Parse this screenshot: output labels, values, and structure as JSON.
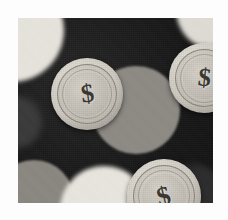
{
  "image": {
    "kind": "photograph",
    "subject": "dollar-sign coins on dark background",
    "palette": {
      "background_dark": "#151515",
      "coin_light": "#cfcbc2",
      "coin_face": "#c2beb5",
      "dollar_dark": "#3a3833",
      "disc_light": "#e6e3dc",
      "disc_mid": "#8d8a84",
      "frame_white": "#fdfdfd"
    },
    "frame": {
      "left": 18,
      "top": 18,
      "width": 195,
      "height": 185
    },
    "discs": [
      {
        "name": "disc-top-left-light",
        "cx": -6,
        "cy": 12,
        "r": 52,
        "color": "#e6e3dc",
        "blur": 2
      },
      {
        "name": "disc-top-right-light",
        "cx": 198,
        "cy": -8,
        "r": 40,
        "color": "#dedbd4",
        "blur": 2
      },
      {
        "name": "disc-center-mid",
        "cx": 118,
        "cy": 92,
        "r": 44,
        "color": "#8d8a84",
        "blur": 1
      },
      {
        "name": "disc-bottom-left-mid",
        "cx": 16,
        "cy": 182,
        "r": 40,
        "color": "#8a8781",
        "blur": 1
      },
      {
        "name": "disc-bottom-left-light",
        "cx": 86,
        "cy": 192,
        "r": 44,
        "color": "#e8e5de",
        "blur": 2
      },
      {
        "name": "disc-bottom-right-dim",
        "cx": 176,
        "cy": 176,
        "r": 30,
        "color": "#2c2c2c",
        "blur": 3
      },
      {
        "name": "disc-left-edge-dim",
        "cx": -2,
        "cy": 104,
        "r": 26,
        "color": "#3a3a3a",
        "blur": 3
      }
    ],
    "coins": [
      {
        "name": "coin-top-left",
        "symbol": "$",
        "cx": 69,
        "cy": 76,
        "d": 72,
        "rotate": -8,
        "symbol_size": 26
      },
      {
        "name": "coin-top-right",
        "symbol": "$",
        "cx": 186,
        "cy": 60,
        "d": 70,
        "rotate": 6,
        "symbol_size": 26
      },
      {
        "name": "coin-bottom-center",
        "symbol": "$",
        "cx": 146,
        "cy": 178,
        "d": 74,
        "rotate": -14,
        "symbol_size": 27
      }
    ]
  }
}
